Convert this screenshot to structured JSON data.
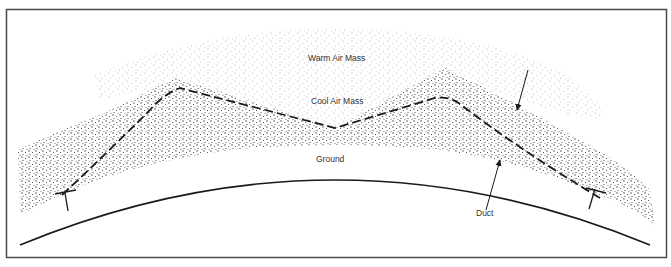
{
  "diagram": {
    "type": "atmospheric-duct-cross-section",
    "labels": {
      "warm_air_mass": "Warm Air Mass",
      "cool_air_mass": "Cool Air Mass",
      "ground": "Ground",
      "duct": "Duct"
    },
    "colors": {
      "frame": "#4a4a4a",
      "line": "#1a1a1a",
      "stipple_warm": "#9a9a9a",
      "stipple_cool": "#2a2a2a",
      "text": "#333333",
      "background": "#ffffff"
    }
  }
}
